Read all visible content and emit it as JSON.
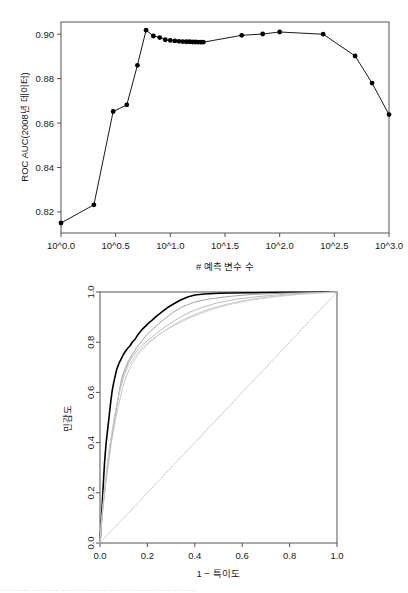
{
  "figure_top": {
    "name": "auc-vs-predictors-plot",
    "chart_data": {
      "type": "line",
      "title": "",
      "xlabel": "# 예측 변수 수",
      "ylabel": "ROC AUC(2008년 데이터)",
      "xlim": [
        0.0,
        3.0
      ],
      "ylim": [
        0.8105,
        0.9055
      ],
      "xscale": "log10",
      "grid": false,
      "xticks": [
        0.0,
        0.5,
        1.0,
        1.5,
        2.0,
        2.5,
        3.0
      ],
      "xticklabels": [
        "10^0.0",
        "10^0.5",
        "10^1.0",
        "10^1.5",
        "10^2.0",
        "10^2.5",
        "10^3.0"
      ],
      "yticks": [
        0.82,
        0.84,
        0.86,
        0.88,
        0.9
      ],
      "yticklabels": [
        "0.82",
        "0.84",
        "0.86",
        "0.88",
        "0.90"
      ],
      "marker": "filled-circle",
      "series": [
        {
          "name": "ROC AUC",
          "color": "#000000",
          "x": [
            0.0,
            0.301,
            0.477,
            0.602,
            0.699,
            0.778,
            0.845,
            0.903,
            0.954,
            1.0,
            1.041,
            1.079,
            1.114,
            1.146,
            1.176,
            1.204,
            1.23,
            1.255,
            1.279,
            1.301,
            1.653,
            1.845,
            2.0,
            2.398,
            2.69,
            2.845,
            3.0
          ],
          "y": [
            0.815,
            0.8232,
            0.8652,
            0.8682,
            0.886,
            0.9018,
            0.8992,
            0.8985,
            0.8975,
            0.8972,
            0.897,
            0.8968,
            0.8967,
            0.8966,
            0.8966,
            0.8965,
            0.8965,
            0.8964,
            0.8964,
            0.8964,
            0.8995,
            0.9001,
            0.901,
            0.9,
            0.8902,
            0.878,
            0.8638
          ]
        }
      ]
    }
  },
  "figure_bottom": {
    "name": "roc-curve-plot",
    "chart_data": {
      "type": "line",
      "title": "",
      "xlabel": "1 − 특이도",
      "ylabel": "민감도",
      "xlim": [
        0.0,
        1.0
      ],
      "ylim": [
        0.0,
        1.0
      ],
      "grid": false,
      "xticks": [
        0.0,
        0.2,
        0.4,
        0.6,
        0.8,
        1.0
      ],
      "xticklabels": [
        "0.0",
        "0.2",
        "0.4",
        "0.6",
        "0.8",
        "1.0"
      ],
      "yticks": [
        0.0,
        0.2,
        0.4,
        0.6,
        0.8,
        1.0
      ],
      "yticklabels": [
        "0.0",
        "0.2",
        "0.4",
        "0.6",
        "0.8",
        "1.0"
      ],
      "series": [
        {
          "name": "주 ROC 곡선",
          "color": "#000000",
          "width": 1.6,
          "x": [
            0.0,
            0.004,
            0.008,
            0.012,
            0.016,
            0.02,
            0.026,
            0.032,
            0.038,
            0.045,
            0.052,
            0.058,
            0.064,
            0.07,
            0.076,
            0.082,
            0.09,
            0.098,
            0.106,
            0.116,
            0.126,
            0.136,
            0.148,
            0.16,
            0.175,
            0.19,
            0.205,
            0.22,
            0.24,
            0.26,
            0.285,
            0.31,
            0.34,
            0.37,
            0.4,
            0.44,
            0.5,
            0.56,
            0.64,
            0.72,
            0.8,
            0.88,
            0.94,
            1.0
          ],
          "y": [
            0.0,
            0.06,
            0.13,
            0.2,
            0.27,
            0.33,
            0.4,
            0.45,
            0.5,
            0.56,
            0.61,
            0.64,
            0.665,
            0.69,
            0.705,
            0.72,
            0.735,
            0.75,
            0.762,
            0.775,
            0.785,
            0.8,
            0.812,
            0.83,
            0.848,
            0.862,
            0.876,
            0.888,
            0.905,
            0.92,
            0.938,
            0.952,
            0.968,
            0.98,
            0.988,
            0.992,
            0.995,
            0.996,
            0.997,
            0.998,
            0.999,
            0.999,
            1.0,
            1.0
          ]
        },
        {
          "name": "개별 폴드 1",
          "color": "#9a9a9a",
          "width": 0.9,
          "x": [
            0.0,
            0.006,
            0.014,
            0.024,
            0.034,
            0.046,
            0.058,
            0.07,
            0.082,
            0.094,
            0.108,
            0.122,
            0.138,
            0.156,
            0.176,
            0.196,
            0.22,
            0.246,
            0.275,
            0.31,
            0.35,
            0.4,
            0.46,
            0.54,
            0.64,
            0.76,
            0.88,
            1.0
          ],
          "y": [
            0.0,
            0.075,
            0.155,
            0.24,
            0.32,
            0.4,
            0.47,
            0.54,
            0.61,
            0.665,
            0.7,
            0.73,
            0.755,
            0.78,
            0.805,
            0.828,
            0.85,
            0.872,
            0.895,
            0.92,
            0.942,
            0.96,
            0.972,
            0.982,
            0.99,
            0.995,
            0.998,
            1.0
          ]
        },
        {
          "name": "개별 폴드 2",
          "color": "#b4b4b4",
          "width": 0.9,
          "x": [
            0.0,
            0.005,
            0.012,
            0.02,
            0.03,
            0.04,
            0.052,
            0.064,
            0.078,
            0.092,
            0.106,
            0.122,
            0.14,
            0.158,
            0.18,
            0.205,
            0.232,
            0.262,
            0.296,
            0.335,
            0.38,
            0.435,
            0.5,
            0.58,
            0.68,
            0.79,
            0.9,
            1.0
          ],
          "y": [
            0.0,
            0.07,
            0.145,
            0.225,
            0.3,
            0.375,
            0.445,
            0.515,
            0.585,
            0.64,
            0.685,
            0.72,
            0.748,
            0.77,
            0.79,
            0.81,
            0.83,
            0.852,
            0.875,
            0.898,
            0.92,
            0.94,
            0.958,
            0.972,
            0.983,
            0.992,
            0.997,
            1.0
          ]
        },
        {
          "name": "개별 폴드 3",
          "color": "#c2c2c2",
          "width": 0.9,
          "x": [
            0.0,
            0.006,
            0.015,
            0.026,
            0.038,
            0.05,
            0.064,
            0.08,
            0.096,
            0.114,
            0.134,
            0.156,
            0.18,
            0.208,
            0.238,
            0.272,
            0.31,
            0.352,
            0.4,
            0.455,
            0.52,
            0.6,
            0.69,
            0.79,
            0.89,
            1.0
          ],
          "y": [
            0.0,
            0.08,
            0.165,
            0.25,
            0.33,
            0.41,
            0.485,
            0.555,
            0.62,
            0.672,
            0.712,
            0.745,
            0.772,
            0.798,
            0.822,
            0.845,
            0.868,
            0.89,
            0.91,
            0.93,
            0.948,
            0.965,
            0.978,
            0.988,
            0.995,
            1.0
          ]
        },
        {
          "name": "개별 폴드 4",
          "color": "#cccccc",
          "width": 0.9,
          "x": [
            0.0,
            0.004,
            0.011,
            0.019,
            0.028,
            0.038,
            0.05,
            0.062,
            0.076,
            0.09,
            0.106,
            0.124,
            0.144,
            0.168,
            0.195,
            0.225,
            0.26,
            0.3,
            0.345,
            0.4,
            0.465,
            0.545,
            0.64,
            0.75,
            0.87,
            1.0
          ],
          "y": [
            0.0,
            0.065,
            0.14,
            0.215,
            0.29,
            0.365,
            0.44,
            0.51,
            0.575,
            0.63,
            0.675,
            0.712,
            0.742,
            0.768,
            0.792,
            0.815,
            0.838,
            0.86,
            0.882,
            0.905,
            0.928,
            0.95,
            0.968,
            0.982,
            0.993,
            1.0
          ]
        },
        {
          "name": "대각선 기준선",
          "color": "#bfbfbf",
          "width": 0.7,
          "x": [
            0.0,
            1.0
          ],
          "y": [
            0.0,
            1.0
          ]
        }
      ]
    }
  },
  "caption_fragment": {
    "text": "⎯ ⎯⎯ ⎯⎯⎯ ⎯⎯ ⎯⎯⎯⎯ ⎯⎯⎯ ⎯⎯ ⎯⎯⎯⎯⎯ ⎯⎯⎯ ⎯⎯ ⎯⎯⎯⎯ ⎯⎯⎯⎯ ⎯⎯ ⎯⎯⎯"
  }
}
